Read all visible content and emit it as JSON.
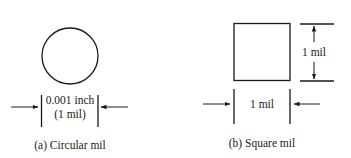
{
  "figure": {
    "circular": {
      "dimension_line1": "0.001 inch",
      "dimension_line2": "(1 mil)",
      "caption": "(a) Circular mil"
    },
    "square": {
      "width_label": "1 mil",
      "height_label": "1 mil",
      "caption": "(b) Square mil"
    },
    "colors": {
      "stroke": "#1a1a1a",
      "background": "#ffffff"
    }
  }
}
